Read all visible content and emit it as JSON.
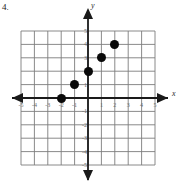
{
  "question_number": "4.",
  "axis_names": {
    "x": "x",
    "y": "y"
  },
  "chart_data": {
    "type": "scatter",
    "title": "",
    "xlabel": "x",
    "ylabel": "y",
    "xlim": [
      -5,
      5
    ],
    "ylim": [
      -5,
      5
    ],
    "grid": true,
    "legend": "none",
    "x_ticks": [
      -5,
      -4,
      -3,
      -2,
      -1,
      1,
      2,
      3,
      4,
      5
    ],
    "y_ticks": [
      5,
      4,
      3,
      2,
      1,
      -1,
      -2,
      -3,
      -4,
      -5
    ],
    "x_tick_labels": [
      "-5",
      "-4",
      "-3",
      "-2",
      "-1",
      "1",
      "2",
      "3",
      "4",
      "5"
    ],
    "y_tick_labels": [
      "5",
      "4",
      "3",
      "2",
      "1",
      "-1",
      "-2",
      "-3",
      "-4",
      "-5"
    ],
    "points": [
      {
        "x": -2,
        "y": 0
      },
      {
        "x": -1,
        "y": 1
      },
      {
        "x": 0,
        "y": 2
      },
      {
        "x": 1,
        "y": 3
      },
      {
        "x": 2,
        "y": 4
      }
    ],
    "marker_color": "#0a0a0a",
    "grid_color": "#7d7d7d",
    "axis_color": "#1a1a1a"
  }
}
